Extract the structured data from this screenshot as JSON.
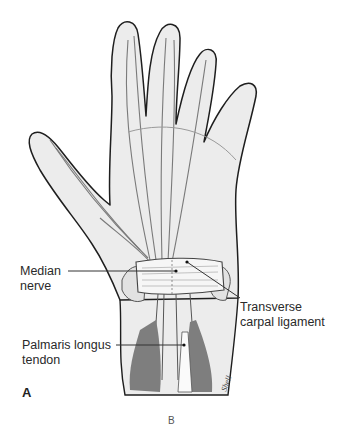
{
  "figure": {
    "panel_label": "A",
    "next_panel_fragment": "B",
    "labels": [
      {
        "id": "median-nerve",
        "line1": "Median",
        "line2": "nerve"
      },
      {
        "id": "transverse-carpal-ligament",
        "line1": "Transverse",
        "line2": "carpal ligament"
      },
      {
        "id": "palmaris-longus-tendon",
        "line1": "Palmaris longus",
        "line2": "tendon"
      }
    ],
    "signature": "Shell",
    "colors": {
      "outline": "#1e1e1e",
      "skin_fill": "#ececec",
      "nerve_stroke": "#7a7a7a",
      "muscle": "#7e7e7e",
      "ligament": "#f6f6f6",
      "leader_line": "#333333"
    }
  }
}
